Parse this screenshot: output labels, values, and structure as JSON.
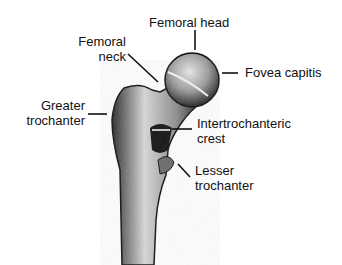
{
  "diagram": {
    "labels": {
      "femoral_head": "Femoral head",
      "femoral_neck_1": "Femoral",
      "femoral_neck_2": "neck",
      "fovea_capitis": "Fovea capitis",
      "greater_trochanter_1": "Greater",
      "greater_trochanter_2": "trochanter",
      "intertrochanteric_crest_1": "Intertrochanteric",
      "intertrochanteric_crest_2": "crest",
      "lesser_trochanter_1": "Lesser",
      "lesser_trochanter_2": "trochanter"
    },
    "colors": {
      "bone_dark": "#1a1a1a",
      "bone_light": "#cfcfcf",
      "line": "#111111"
    }
  }
}
